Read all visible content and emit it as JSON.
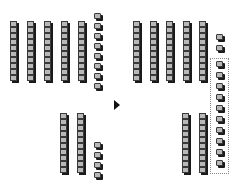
{
  "diagram": {
    "type": "base-ten blocks regrouping",
    "left": {
      "top": {
        "tens": 5,
        "ones": 8
      },
      "bottom": {
        "tens": 2,
        "ones": 4
      }
    },
    "right": {
      "top": {
        "tens": 5,
        "ones_loose": 2,
        "ones_grouped": 10
      },
      "bottom": {
        "tens": 2
      }
    },
    "arrow": "right-arrow",
    "colors": {
      "cube": "#b8b8b8",
      "outline": "#3a3a3a",
      "shadow": "#1a1a1a"
    }
  },
  "layout": {
    "rod_cubes": 10,
    "left_top_rod_x": [
      10,
      27,
      44,
      61,
      78
    ],
    "left_top_ones_x": 94,
    "left_bottom_rod_x": [
      60,
      77
    ],
    "left_bottom_ones_x": 94,
    "right_top_rod_x": [
      133,
      150,
      166,
      183,
      199
    ],
    "right_ones_x": 216,
    "right_bottom_rod_x": [
      182,
      199
    ]
  }
}
